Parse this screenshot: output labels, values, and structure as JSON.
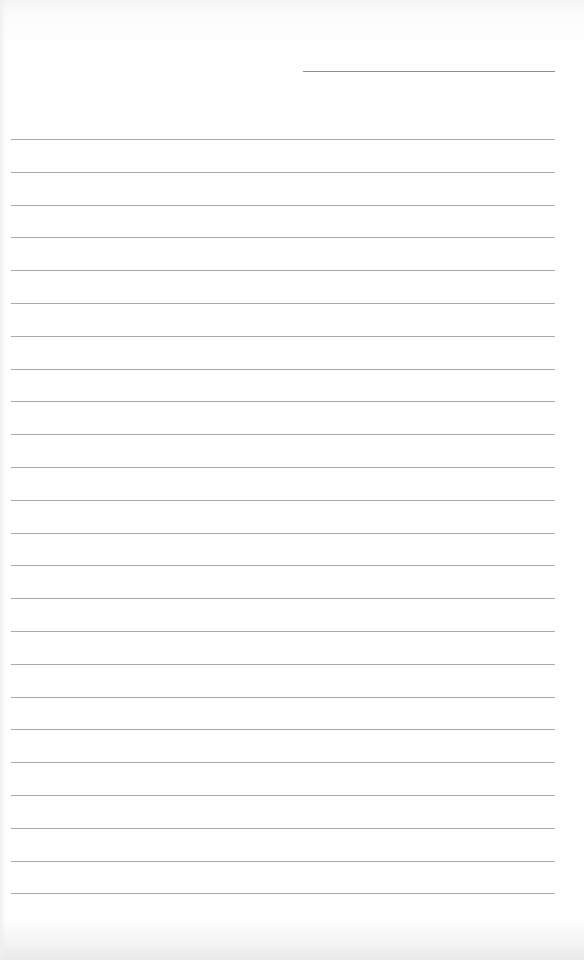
{
  "document": {
    "type": "lined-paper",
    "header_line": {
      "x": 303,
      "y": 71,
      "width": 252
    },
    "ruled_lines": {
      "count": 24,
      "x": 11,
      "width": 544,
      "first_y": 139,
      "spacing": 32.8
    },
    "colors": {
      "paper": "#fdfdfd",
      "rule": "#9a9a9a"
    },
    "text_content": []
  }
}
